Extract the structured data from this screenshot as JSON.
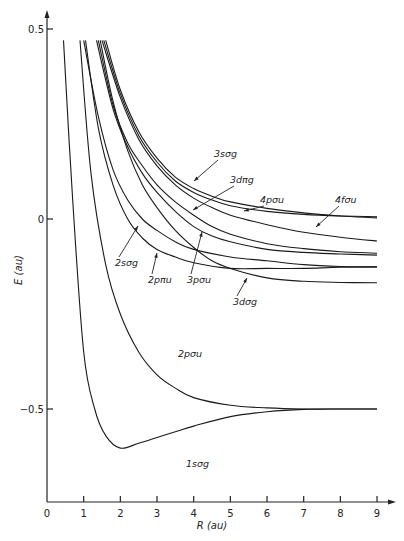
{
  "chart_data": {
    "type": "line",
    "title": "",
    "xlabel": "R (au)",
    "ylabel": "E (au)",
    "xlim": [
      0,
      9
    ],
    "ylim": [
      -0.75,
      0.5
    ],
    "grid": false,
    "x_ticks": [
      "0",
      "1",
      "2",
      "3",
      "4",
      "5",
      "6",
      "7",
      "8",
      "9"
    ],
    "y_ticks": [
      {
        "value": 0.5,
        "label": "0.5"
      },
      {
        "value": 0,
        "label": "0"
      },
      {
        "value": -0.5,
        "label": "-0.5"
      }
    ],
    "series": [
      {
        "name": "1sσg",
        "x": [
          0.45,
          0.7,
          1.0,
          1.3,
          1.6,
          2.0,
          2.5,
          3.0,
          3.5,
          4.0,
          5.0,
          6.0,
          7.0,
          8.0,
          9.0
        ],
        "y": [
          0.47,
          0.05,
          -0.35,
          -0.5,
          -0.57,
          -0.603,
          -0.59,
          -0.575,
          -0.56,
          -0.545,
          -0.52,
          -0.507,
          -0.501,
          -0.5,
          -0.5
        ]
      },
      {
        "name": "2pσu",
        "x": [
          0.9,
          1.2,
          1.6,
          2.0,
          2.5,
          3.0,
          3.5,
          4.0,
          5.0,
          6.0,
          7.0,
          8.0,
          9.0
        ],
        "y": [
          0.47,
          0.12,
          -0.12,
          -0.25,
          -0.35,
          -0.41,
          -0.445,
          -0.47,
          -0.49,
          -0.497,
          -0.5,
          -0.5,
          -0.5
        ]
      },
      {
        "name": "2sσg",
        "x": [
          1.0,
          1.4,
          1.8,
          2.2,
          2.6,
          3.0,
          3.5,
          4.0,
          5.0,
          6.0,
          7.0,
          8.0,
          9.0
        ],
        "y": [
          0.47,
          0.27,
          0.13,
          0.05,
          0.0,
          -0.03,
          -0.06,
          -0.08,
          -0.1,
          -0.11,
          -0.12,
          -0.125,
          -0.126
        ]
      },
      {
        "name": "2pπu",
        "x": [
          1.05,
          1.4,
          1.8,
          2.2,
          2.6,
          3.0,
          3.5,
          4.0,
          5.0,
          6.0,
          7.0,
          8.0,
          9.0
        ],
        "y": [
          0.47,
          0.24,
          0.09,
          0.0,
          -0.05,
          -0.08,
          -0.1,
          -0.115,
          -0.13,
          -0.13,
          -0.13,
          -0.127,
          -0.126
        ]
      },
      {
        "name": "3pσu",
        "x": [
          1.35,
          1.8,
          2.2,
          2.6,
          3.0,
          3.5,
          4.0,
          4.5,
          5.0,
          6.0,
          7.0,
          8.0,
          9.0
        ],
        "y": [
          0.47,
          0.29,
          0.19,
          0.12,
          0.07,
          0.02,
          -0.02,
          -0.045,
          -0.06,
          -0.08,
          -0.088,
          -0.092,
          -0.095
        ]
      },
      {
        "name": "3dπg",
        "x": [
          1.4,
          1.8,
          2.2,
          2.6,
          3.0,
          3.5,
          4.0,
          4.5,
          5.0,
          6.0,
          7.0,
          8.0,
          9.0
        ],
        "y": [
          0.47,
          0.3,
          0.2,
          0.14,
          0.09,
          0.045,
          0.01,
          -0.02,
          -0.04,
          -0.065,
          -0.078,
          -0.086,
          -0.09
        ]
      },
      {
        "name": "3dσg",
        "x": [
          1.45,
          1.8,
          2.2,
          2.6,
          3.0,
          3.5,
          4.0,
          4.5,
          5.0,
          6.0,
          7.0,
          8.0,
          9.0
        ],
        "y": [
          0.47,
          0.31,
          0.18,
          0.09,
          0.03,
          -0.03,
          -0.075,
          -0.11,
          -0.13,
          -0.155,
          -0.164,
          -0.167,
          -0.168
        ]
      },
      {
        "name": "3sσg",
        "x": [
          1.55,
          2.0,
          2.5,
          3.0,
          3.5,
          4.0,
          4.5,
          5.0,
          6.0,
          7.0,
          8.0,
          9.0
        ],
        "y": [
          0.47,
          0.33,
          0.22,
          0.15,
          0.1,
          0.07,
          0.05,
          0.035,
          0.02,
          0.012,
          0.008,
          0.006
        ]
      },
      {
        "name": "4pσu",
        "x": [
          1.6,
          2.0,
          2.5,
          3.0,
          3.5,
          4.0,
          4.5,
          5.0,
          6.0,
          7.0,
          8.0,
          9.0
        ],
        "y": [
          0.47,
          0.34,
          0.23,
          0.16,
          0.11,
          0.08,
          0.06,
          0.045,
          0.028,
          0.016,
          0.008,
          0.003
        ]
      },
      {
        "name": "4fσu",
        "x": [
          1.5,
          2.0,
          2.5,
          3.0,
          3.5,
          4.0,
          4.5,
          5.0,
          6.0,
          7.0,
          8.0,
          9.0
        ],
        "y": [
          0.47,
          0.32,
          0.21,
          0.14,
          0.09,
          0.055,
          0.03,
          0.01,
          -0.015,
          -0.035,
          -0.048,
          -0.058
        ]
      }
    ],
    "annotations": [
      {
        "label": "3sσg",
        "target_x": 3.85,
        "target_y": 0.075
      },
      {
        "label": "3dπg",
        "target_x": 3.95,
        "target_y": 0.015
      },
      {
        "label": "4pσu",
        "target_x": 5.3,
        "target_y": 0.04
      },
      {
        "label": "4fσu",
        "target_x": 6.9,
        "target_y": -0.03
      },
      {
        "label": "2sσg",
        "target_x": 2.5,
        "target_y": -0.02
      },
      {
        "label": "2pπu",
        "target_x": 3.0,
        "target_y": -0.085
      },
      {
        "label": "3pσu",
        "target_x": 4.2,
        "target_y": -0.03
      },
      {
        "label": "3dσg",
        "target_x": 6.0,
        "target_y": -0.155
      },
      {
        "label": "2pσu",
        "target_x": null,
        "target_y": null
      },
      {
        "label": "1sσg",
        "target_x": null,
        "target_y": null
      }
    ]
  }
}
